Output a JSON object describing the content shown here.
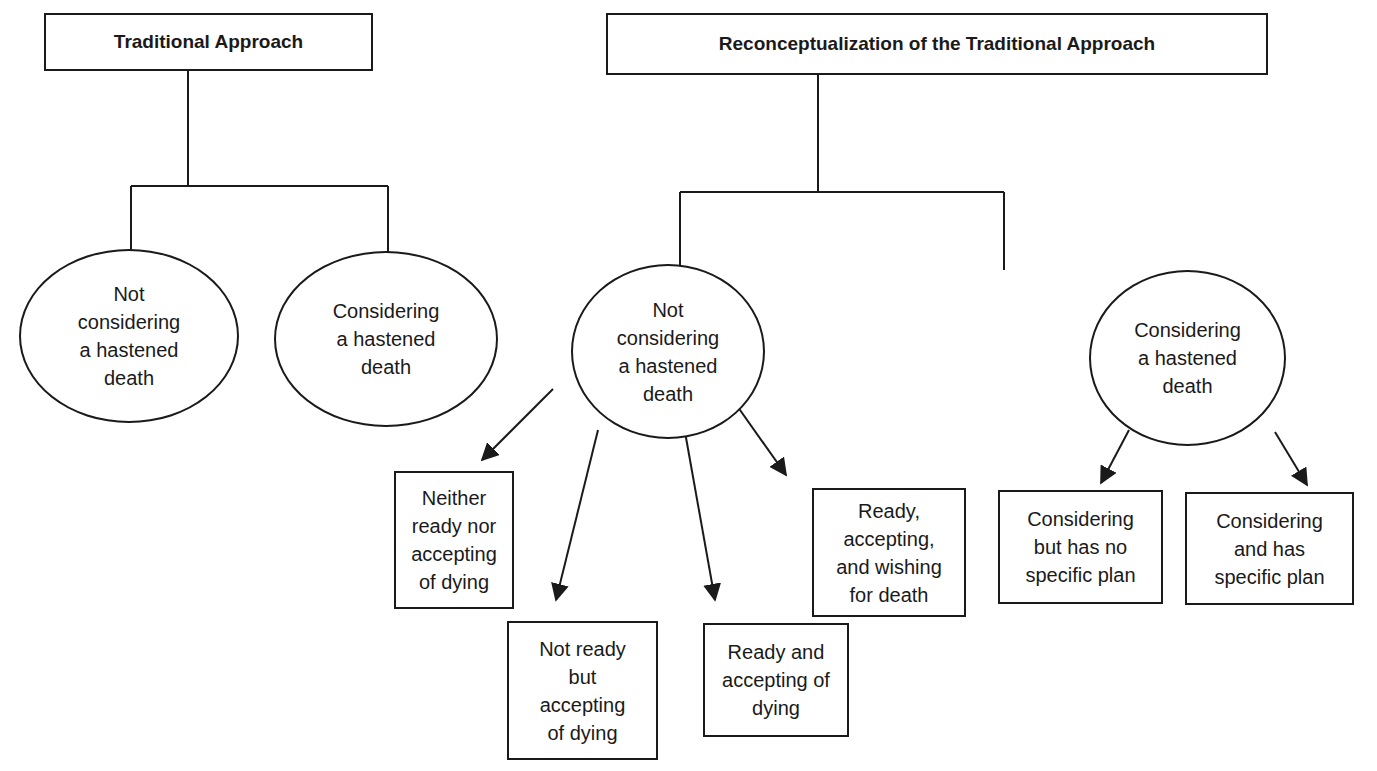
{
  "diagram": {
    "type": "tree",
    "branches": {
      "traditional": {
        "title": "Traditional Approach",
        "children": [
          {
            "label": "Not\nconsidering\na hastened\ndeath",
            "shape": "ellipse"
          },
          {
            "label": "Considering\na hastened\ndeath",
            "shape": "ellipse"
          }
        ]
      },
      "reconceptualization": {
        "title": "Reconceptualization of the Traditional Approach",
        "children": [
          {
            "label": "Not\nconsidering\na hastened\ndeath",
            "shape": "ellipse",
            "children": [
              {
                "label": "Neither\nready nor\naccepting\nof dying",
                "shape": "rect"
              },
              {
                "label": "Not ready\nbut\naccepting\nof dying",
                "shape": "rect"
              },
              {
                "label": "Ready and\naccepting of\ndying",
                "shape": "rect"
              },
              {
                "label": "Ready,\naccepting,\nand wishing\nfor death",
                "shape": "rect"
              }
            ]
          },
          {
            "label": "Considering\na hastened\ndeath",
            "shape": "ellipse",
            "children": [
              {
                "label": "Considering\nbut has no\nspecific plan",
                "shape": "rect"
              },
              {
                "label": "Considering\nand has\nspecific plan",
                "shape": "rect"
              }
            ]
          }
        ]
      }
    },
    "colors": {
      "line": "#1a1a1a",
      "background": "#ffffff"
    }
  }
}
